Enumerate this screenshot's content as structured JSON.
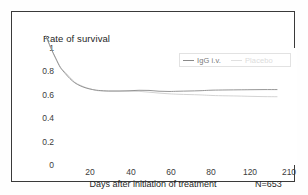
{
  "figure": {
    "title": "Rate of survival",
    "sample_size_label": "N=653",
    "frame_color": "#3a3a3a",
    "background": "#ffffff"
  },
  "legend": {
    "position": "top-right-inside",
    "border_color": "#e2e2e2",
    "entries": [
      {
        "label": "IgG i.v.",
        "color": "#8a8a8a",
        "text_color": "#7a7a7a"
      },
      {
        "label": "Placebo",
        "color": "#dcdcdc",
        "text_color": "#d2d2d2"
      }
    ]
  },
  "axes": {
    "y_ticks": [
      "1",
      "0.8",
      "0.6",
      "0.4",
      "0.2",
      "0"
    ],
    "x_ticks": [
      "20",
      "40",
      "60",
      "80",
      "120",
      "210"
    ],
    "x_title": "Days after initiation of treatment",
    "y_title": "Rate of survival"
  },
  "chart_data": {
    "type": "line",
    "title": "Rate of survival",
    "subtitle": "",
    "xlabel": "Days after initiation of treatment",
    "ylabel": "Rate of survival",
    "annotations": [
      "N=653"
    ],
    "grid": false,
    "legend_position": "upper right",
    "xlim": [
      0,
      210
    ],
    "ylim": [
      0,
      1
    ],
    "x_tick_values": [
      20,
      40,
      60,
      80,
      120,
      210
    ],
    "x_axis_scale": "compressed-tail",
    "y_tick_values": [
      0,
      0.2,
      0.4,
      0.6,
      0.8,
      1
    ],
    "x": [
      0,
      3,
      6,
      9,
      12,
      15,
      18,
      21,
      24,
      27,
      30,
      35,
      40,
      45,
      50,
      55,
      60,
      65,
      70,
      80,
      90,
      100,
      120,
      150,
      180,
      210
    ],
    "series": [
      {
        "name": "IgG i.v.",
        "color": "#8a8a8a",
        "values": [
          1.0,
          0.9,
          0.81,
          0.73,
          0.68,
          0.635,
          0.6,
          0.575,
          0.555,
          0.543,
          0.535,
          0.53,
          0.53,
          0.532,
          0.536,
          0.535,
          0.528,
          0.526,
          0.528,
          0.532,
          0.536,
          0.538,
          0.54,
          0.541,
          0.542,
          0.542
        ]
      },
      {
        "name": "Placebo",
        "color": "#c8c8c8",
        "values": [
          1.0,
          0.895,
          0.815,
          0.735,
          0.69,
          0.645,
          0.605,
          0.58,
          0.558,
          0.542,
          0.532,
          0.528,
          0.528,
          0.528,
          0.527,
          0.52,
          0.512,
          0.506,
          0.502,
          0.497,
          0.493,
          0.49,
          0.487,
          0.484,
          0.482,
          0.481
        ]
      }
    ]
  }
}
